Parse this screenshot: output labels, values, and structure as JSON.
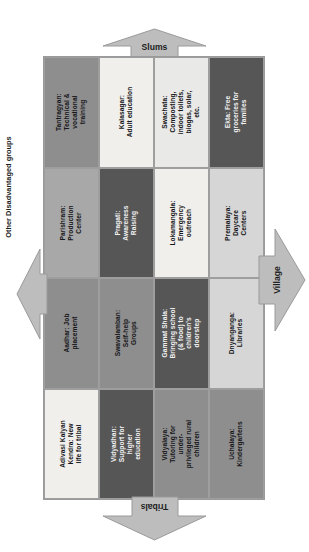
{
  "diagram": {
    "colors": {
      "dark": "#565656",
      "mid": "#8e8e8e",
      "midlight": "#a8a8a8",
      "light": "#d6d6d6",
      "pale": "#e9e9e7",
      "paler": "#f0efec",
      "arrow_fill": "#bdbdbd",
      "arrow_stroke": "#9a9a9a",
      "text_dark": "#16161a",
      "text_light": "#f2f2f2"
    },
    "arrows": [
      {
        "name": "slums",
        "label": "Slums",
        "direction": "up"
      },
      {
        "name": "village",
        "label": "Village",
        "direction": "right"
      },
      {
        "name": "tribals",
        "label": "Tribals",
        "direction": "down"
      },
      {
        "name": "other",
        "label": "Other Disadvantaged groups",
        "direction": "left"
      }
    ],
    "cells": [
      {
        "label": "Tantragyan: Technical & vocational training",
        "tone": "t-mid"
      },
      {
        "label": "Kalasagar: Adult education",
        "tone": "t-paler"
      },
      {
        "label": "Swachata: Composting, indoor toilets, biogas, solar, etc.",
        "tone": "t-pale"
      },
      {
        "label": "Ekta: Free groceries for families",
        "tone": "t-dark"
      },
      {
        "label": "Parishram: Production Center",
        "tone": "t-midlight"
      },
      {
        "label": "Pragati: Awareness Raising",
        "tone": "t-dark"
      },
      {
        "label": "Lokamangala: Emergency outreach",
        "tone": "t-paler"
      },
      {
        "label": "Premalaya: Daycare Centers",
        "tone": "t-light"
      },
      {
        "label": "Aadhar: Job placement",
        "tone": "t-mid"
      },
      {
        "label": "Swavalamban: Self-help Groups",
        "tone": "t-mid"
      },
      {
        "label": "Gammat Shala: Bringing school (& food) to children's doorstep",
        "tone": "t-dark"
      },
      {
        "label": "Dnyanganga: Libraries",
        "tone": "t-light"
      },
      {
        "label": "Adivasi Kalyan Kendra: New life for tribal",
        "tone": "t-paler"
      },
      {
        "label": "Vidyadhan: Support for higher education",
        "tone": "t-dark"
      },
      {
        "label": "Vidyalaya: Tutoring for under-privileged rural children",
        "tone": "t-mid"
      },
      {
        "label": "Uchalaya: Kindergartens",
        "tone": "t-mid"
      }
    ]
  }
}
